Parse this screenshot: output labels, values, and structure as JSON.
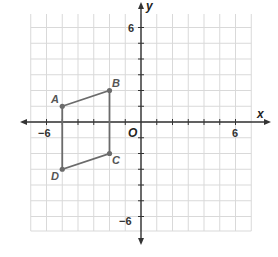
{
  "diagram": {
    "type": "coordinate-plane",
    "origin_label": "O",
    "x_axis_label": "x",
    "y_axis_label": "y",
    "x_range": [
      -7,
      7
    ],
    "y_range": [
      -7,
      7
    ],
    "tick_labels": {
      "x_neg": "−6",
      "x_pos": "6",
      "y_pos": "6",
      "y_neg": "−6"
    },
    "colors": {
      "grid": "#d9d9d9",
      "axis": "#333333",
      "shape": "#6b6b6b"
    },
    "shape": {
      "name": "quadrilateral ABCD",
      "vertices": [
        {
          "label": "A",
          "x": -5,
          "y": 1
        },
        {
          "label": "B",
          "x": -2,
          "y": 2
        },
        {
          "label": "C",
          "x": -2,
          "y": -2
        },
        {
          "label": "D",
          "x": -5,
          "y": -3
        }
      ]
    }
  }
}
